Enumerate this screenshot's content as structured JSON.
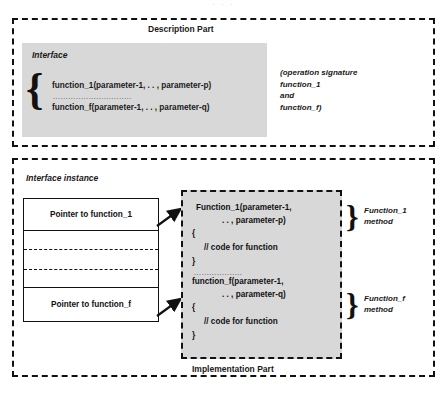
{
  "top_remnant": "· · ·",
  "description": {
    "title": "Description Part",
    "interface_title": "Interface",
    "brace": "{",
    "signature_1": "function_1(parameter-1, . . , parameter-p)",
    "signature_dots": "...............................",
    "signature_f": "function_f(parameter-1, . . , parameter-q)",
    "note": "(operation signature\nfunction_1\nand\nfunction_f)"
  },
  "implementation": {
    "instance_title": "Interface instance",
    "pointer_rows": [
      {
        "label": "Pointer to function_1"
      },
      {
        "label": ""
      },
      {
        "label": ""
      },
      {
        "label": ""
      },
      {
        "label": "Pointer to function_f"
      }
    ],
    "code_lines": [
      "Function_1(parameter-1,",
      ". . , parameter-p)",
      "{",
      "// code for function",
      "}",
      "function_f(parameter-1,",
      ". . , parameter-q)",
      "{",
      "// code for function",
      "}"
    ],
    "code_dots": "...................",
    "brace_1": "}",
    "brace_2": "}",
    "method_label_1": "Function_1\nmethod",
    "method_label_2": "Function_f\nmethod",
    "title": "Implementation Part"
  },
  "colors": {
    "panel_border": "#111111",
    "gray_fill": "#d8d8d8",
    "text": "#1a1a1a",
    "background": "#ffffff"
  }
}
